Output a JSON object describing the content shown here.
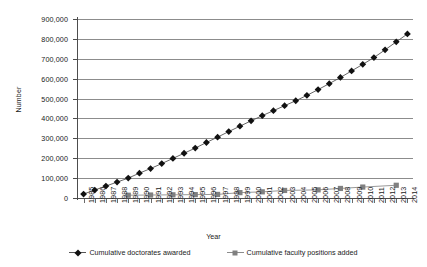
{
  "chart_data": {
    "type": "line",
    "title": "",
    "xlabel": "Year",
    "ylabel": "Number",
    "ylim": [
      0,
      900000
    ],
    "ytick_step": 100000,
    "grid": true,
    "legend_position": "bottom",
    "ytick_labels": [
      "0",
      "100,000",
      "200,000",
      "300,000",
      "400,000",
      "500,000",
      "600,000",
      "700,000",
      "800,000",
      "900,000"
    ],
    "ytick_values": [
      0,
      100000,
      200000,
      300000,
      400000,
      500000,
      600000,
      700000,
      800000,
      900000
    ],
    "categories": [
      "1985",
      "1986",
      "1987",
      "1988",
      "1989",
      "1990",
      "1991",
      "1992",
      "1993",
      "1994",
      "1995",
      "1996",
      "1997",
      "1998",
      "1999",
      "2000",
      "2001",
      "2002",
      "2003",
      "2004",
      "2005",
      "2006",
      "2007",
      "2008",
      "2009",
      "2010",
      "2011",
      "2012",
      "2013",
      "2014"
    ],
    "x": [
      1985,
      1986,
      1987,
      1988,
      1989,
      1990,
      1991,
      1992,
      1993,
      1994,
      1995,
      1996,
      1997,
      1998,
      1999,
      2000,
      2001,
      2002,
      2003,
      2004,
      2005,
      2006,
      2007,
      2008,
      2009,
      2010,
      2011,
      2012,
      2013,
      2014
    ],
    "series": [
      {
        "name": "Cumulative doctorates awarded",
        "marker": "diamond",
        "color": "#111111",
        "line_color": "#555555",
        "x": [
          1985,
          1986,
          1987,
          1988,
          1989,
          1990,
          1991,
          1992,
          1993,
          1994,
          1995,
          1996,
          1997,
          1998,
          1999,
          2000,
          2001,
          2002,
          2003,
          2004,
          2005,
          2006,
          2007,
          2008,
          2009,
          2010,
          2011,
          2012,
          2013,
          2014
        ],
        "values": [
          20000,
          40000,
          60000,
          80000,
          100000,
          125000,
          148000,
          173000,
          199000,
          225000,
          251000,
          279000,
          306000,
          334000,
          361000,
          388000,
          414000,
          439000,
          464000,
          489000,
          516000,
          545000,
          575000,
          606000,
          639000,
          672000,
          706000,
          745000,
          785000,
          825000
        ]
      },
      {
        "name": "Cumulative faculty positions added",
        "marker": "square",
        "color": "#808080",
        "line_color": "#8c8c8c",
        "x": [
          1989,
          1991,
          1993,
          1995,
          1997,
          1999,
          2001,
          2003,
          2006,
          2008,
          2010,
          2013
        ],
        "values": [
          14000,
          15000,
          16000,
          17000,
          18000,
          27000,
          31000,
          38000,
          41000,
          48000,
          55000,
          64000
        ]
      }
    ]
  },
  "legend": [
    {
      "label": "Cumulative doctorates awarded",
      "marker": "diamond"
    },
    {
      "label": "Cumulative faculty positions added",
      "marker": "square"
    }
  ]
}
